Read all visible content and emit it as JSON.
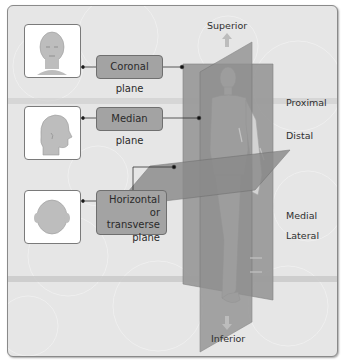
{
  "diagram": {
    "planes": [
      {
        "id": "coronal",
        "label": "Coronal plane",
        "thumbnail": "face-front-view-icon"
      },
      {
        "id": "median",
        "label": "Median plane",
        "thumbnail": "head-side-view-icon"
      },
      {
        "id": "horizontal",
        "label_lines": [
          "Horizontal or",
          "transverse",
          "plane"
        ],
        "thumbnail": "head-top-view-icon"
      }
    ],
    "directions": {
      "superior": "Superior",
      "inferior": "Inferior",
      "proximal": "Proximal",
      "distal": "Distal",
      "medial": "Medial",
      "lateral": "Lateral"
    },
    "colors": {
      "panel_bg": "#e6e6e6",
      "plane_fill": "#9a9a9a",
      "label_fill": "#a3a3a3",
      "skin": "#cfcfcf",
      "text": "#2f2f2f"
    }
  }
}
